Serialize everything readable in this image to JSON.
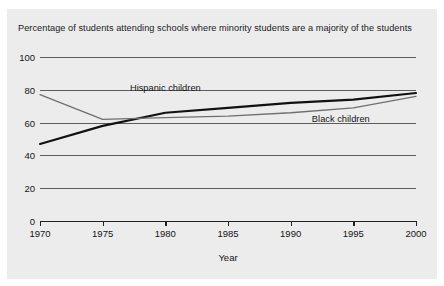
{
  "chart_data": {
    "type": "line",
    "title": "Percentage of students attending schools where minority students are a majority of the students",
    "xlabel": "Year",
    "ylabel": "",
    "xlim": [
      1970,
      2000
    ],
    "ylim": [
      0,
      100
    ],
    "grid": true,
    "legend_position": "inline-labels",
    "yticks": [
      "100",
      "80",
      "60",
      "40",
      "20",
      "0"
    ],
    "ytick_values": [
      100,
      80,
      60,
      40,
      20,
      0
    ],
    "xticks": [
      "1970",
      "1975",
      "1980",
      "1985",
      "1990",
      "1995",
      "2000"
    ],
    "xtick_values": [
      1970,
      1975,
      1980,
      1985,
      1990,
      1995,
      2000
    ],
    "x": [
      1970,
      1975,
      1980,
      1985,
      1990,
      1995,
      2000
    ],
    "series": [
      {
        "name": "Hispanic children",
        "color": "#111111",
        "width": 2.1,
        "values": [
          47,
          58,
          66,
          69,
          72,
          74,
          78
        ],
        "label_x": 1980,
        "label_y": 81
      },
      {
        "name": "Black children",
        "color": "#6f6f6f",
        "width": 1.3,
        "values": [
          77,
          62,
          63,
          64,
          66,
          69,
          76
        ],
        "label_x": 1994,
        "label_y": 62
      }
    ]
  },
  "colors": {
    "page_background": "#ffffff",
    "panel_background": "#ececed",
    "grid": "#5c5c5c",
    "axis": "#222222",
    "text": "#141414"
  }
}
